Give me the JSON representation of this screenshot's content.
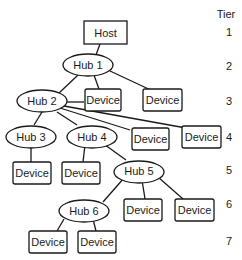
{
  "tier_header": "Tier",
  "tiers": [
    "1",
    "2",
    "3",
    "4",
    "5",
    "6",
    "7"
  ],
  "nodes": {
    "host": "Host",
    "hub1": "Hub 1",
    "hub2": "Hub 2",
    "hub3": "Hub 3",
    "hub4": "Hub 4",
    "hub5": "Hub 5",
    "hub6": "Hub 6",
    "device_label": "Device"
  }
}
